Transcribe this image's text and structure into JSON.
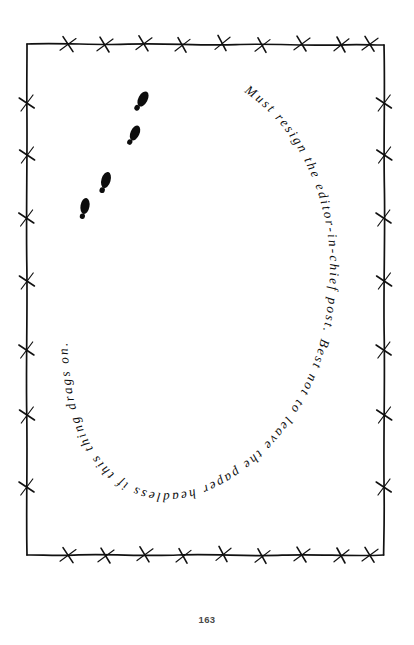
{
  "page": {
    "number": "163",
    "background_color": "#ffffff",
    "ink_color": "#0d0d0d"
  },
  "border": {
    "name": "barbed-wire-frame",
    "description": "hand-drawn barbed wire rectangle border",
    "stroke_color": "#111111",
    "barb_count_top": 9,
    "barb_count_bottom": 9,
    "barb_count_left": 7,
    "barb_count_right": 7
  },
  "artwork": {
    "footprints": {
      "name": "shoe-prints-trail",
      "count": 4,
      "description": "four black shoe prints ascending diagonally from lower-left to upper-right",
      "color": "#0d0d0d"
    }
  },
  "inscription": {
    "name": "curved-handwritten-note",
    "full_text": "Must resign the editor-in-chief post. Best not to leave the paper headless if this thing drags on.",
    "segments": [
      "Must resign the editor-in-chief post.",
      "Best not to leave the paper headless if this thing drags on."
    ],
    "path_shape": "ellipse-arc",
    "color": "#0d0d0d"
  }
}
